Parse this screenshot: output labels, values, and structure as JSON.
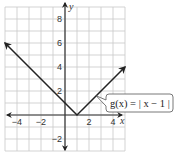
{
  "chart_data": {
    "type": "line",
    "title": "",
    "xlabel": "x",
    "ylabel": "y",
    "xlim": [
      -5,
      5
    ],
    "ylim": [
      -3,
      9
    ],
    "grid": true,
    "x_ticks": [
      -4,
      -2,
      2,
      4
    ],
    "y_ticks": [
      -2,
      2,
      4,
      6,
      8
    ],
    "x_tick_labels": [
      "−4",
      "−2",
      "2",
      "4"
    ],
    "y_tick_labels": [
      "−2",
      "2",
      "4",
      "6",
      "8"
    ],
    "series": [
      {
        "name": "g(x) = | x − 1 |",
        "x": [
          -5,
          1,
          5
        ],
        "y": [
          6,
          0,
          4
        ],
        "arrows_at_ends": true
      }
    ],
    "annotations": [
      {
        "text_prefix": "g",
        "text": "g(x) = | x − 1 |",
        "points_to": [
          2.6,
          1.6
        ]
      }
    ],
    "legend": "none"
  },
  "colors": {
    "grid": "#c8c8c8",
    "axis": "#333333",
    "curve": "#222222",
    "label_border": "#555555"
  }
}
